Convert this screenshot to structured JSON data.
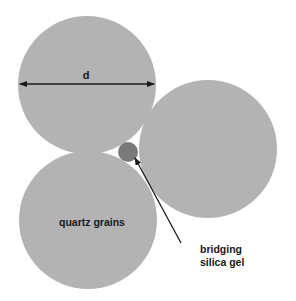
{
  "colors": {
    "grain": "#b3b3b3",
    "gel": "#7a7a7a",
    "ink": "#1a1a1a",
    "background": "#ffffff"
  },
  "labels": {
    "diameter": "d",
    "grains": "quartz grains",
    "gel_line1": "bridging",
    "gel_line2": "silica gel"
  }
}
